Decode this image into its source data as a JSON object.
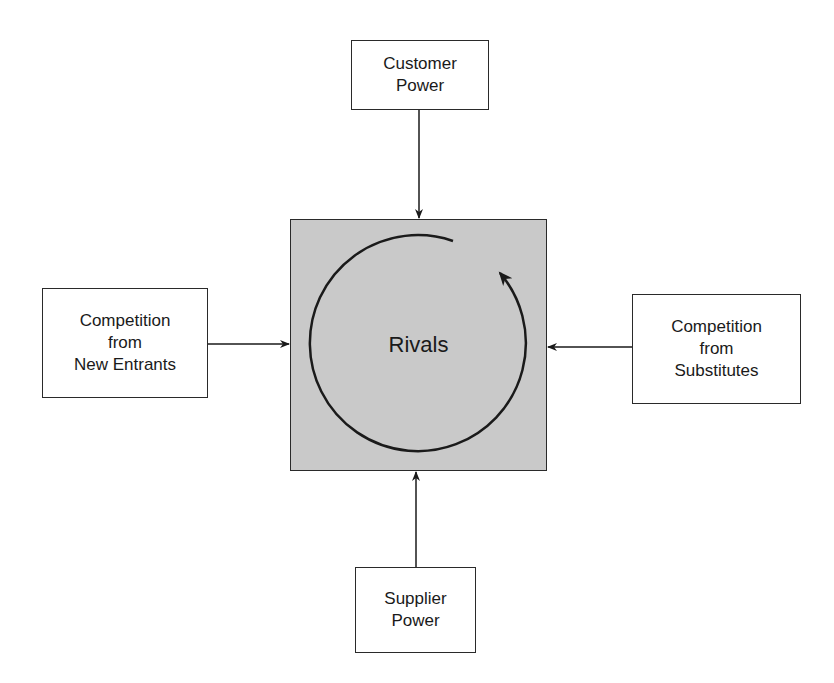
{
  "diagram": {
    "center": {
      "label": "Rivals",
      "fill": "#c9c9c9"
    },
    "forces": {
      "top": {
        "lines": [
          "Customer",
          "Power"
        ]
      },
      "left": {
        "lines": [
          "Competition",
          "from",
          "New Entrants"
        ]
      },
      "right": {
        "lines": [
          "Competition",
          "from",
          "Substitutes"
        ]
      },
      "bottom": {
        "lines": [
          "Supplier",
          "Power"
        ]
      }
    },
    "edges": [
      {
        "from": "Customer Power",
        "to": "Rivals"
      },
      {
        "from": "Competition from New Entrants",
        "to": "Rivals"
      },
      {
        "from": "Competition from Substitutes",
        "to": "Rivals"
      },
      {
        "from": "Supplier Power",
        "to": "Rivals"
      }
    ],
    "cycle_arrow": {
      "direction": "clockwise-around-rivals"
    }
  }
}
